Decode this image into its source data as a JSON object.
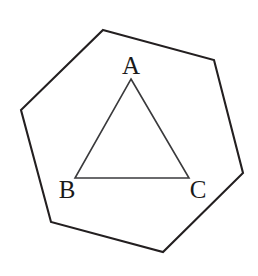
{
  "figure": {
    "type": "geometry-diagram",
    "background_color": "#ffffff",
    "canvas": {
      "width": 258,
      "height": 276
    },
    "hexagon": {
      "name": "outer-hexagon",
      "stroke_color": "#231f20",
      "stroke_width": 2.1,
      "fill": "none",
      "points": "103,30 214,60 243,173 163,252 51,222 21,110",
      "vertices": [
        {
          "label": "",
          "x": 103,
          "y": 30
        },
        {
          "label": "",
          "x": 214,
          "y": 60
        },
        {
          "label": "",
          "x": 243,
          "y": 173
        },
        {
          "label": "",
          "x": 163,
          "y": 252
        },
        {
          "label": "",
          "x": 51,
          "y": 222
        },
        {
          "label": "",
          "x": 21,
          "y": 110
        }
      ]
    },
    "triangle": {
      "name": "inner-triangle",
      "stroke_color": "#3a3a3c",
      "stroke_width": 1.6,
      "fill": "none",
      "points": "131,79 189,178 75,178",
      "vertices": [
        {
          "label": "A",
          "x": 131,
          "y": 79
        },
        {
          "label": "C",
          "x": 189,
          "y": 178
        },
        {
          "label": "B",
          "x": 75,
          "y": 178
        }
      ]
    },
    "labels": [
      {
        "name": "vertex-label-a",
        "text": "A",
        "x": 131,
        "y": 74,
        "anchor": "middle"
      },
      {
        "name": "vertex-label-b",
        "text": "B",
        "x": 67,
        "y": 198,
        "anchor": "middle"
      },
      {
        "name": "vertex-label-c",
        "text": "C",
        "x": 198,
        "y": 198,
        "anchor": "middle"
      }
    ]
  }
}
